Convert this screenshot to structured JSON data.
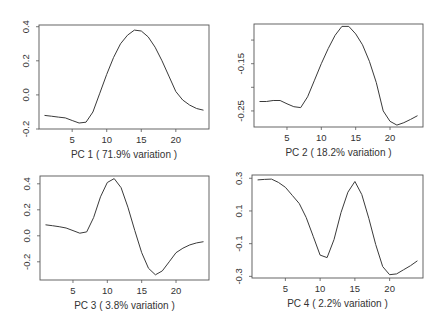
{
  "chart_data": [
    {
      "type": "line",
      "title": "",
      "xlabel": "PC 1 ( 71.9% variation )",
      "ylabel": "",
      "x": [
        1,
        2,
        3,
        4,
        5,
        6,
        7,
        8,
        9,
        10,
        11,
        12,
        13,
        14,
        15,
        16,
        17,
        18,
        19,
        20,
        21,
        22,
        23,
        24
      ],
      "values": [
        -0.12,
        -0.125,
        -0.13,
        -0.135,
        -0.15,
        -0.165,
        -0.16,
        -0.1,
        0.01,
        0.12,
        0.22,
        0.3,
        0.35,
        0.38,
        0.375,
        0.34,
        0.28,
        0.2,
        0.11,
        0.02,
        -0.03,
        -0.06,
        -0.08,
        -0.09
      ],
      "xticks": [
        5,
        10,
        15,
        20
      ],
      "yticks": [
        -0.2,
        0.0,
        0.2,
        0.4
      ],
      "ytick_labels": [
        "-0.2",
        "0.0",
        "0.2",
        "0.4"
      ],
      "xlim": [
        0.2,
        24.8
      ],
      "ylim": [
        -0.2,
        0.41
      ],
      "grid": false,
      "box": {
        "x": 39,
        "y": 25,
        "w": 170,
        "h": 104
      }
    },
    {
      "type": "line",
      "title": "",
      "xlabel": "PC 2 ( 18.2% variation )",
      "ylabel": "",
      "x": [
        1,
        2,
        3,
        4,
        5,
        6,
        7,
        8,
        9,
        10,
        11,
        12,
        13,
        14,
        15,
        16,
        17,
        18,
        19,
        20,
        21,
        22,
        23,
        24
      ],
      "values": [
        -0.23,
        -0.23,
        -0.228,
        -0.228,
        -0.235,
        -0.241,
        -0.243,
        -0.22,
        -0.185,
        -0.15,
        -0.118,
        -0.09,
        -0.071,
        -0.071,
        -0.087,
        -0.11,
        -0.145,
        -0.19,
        -0.25,
        -0.272,
        -0.28,
        -0.275,
        -0.268,
        -0.26
      ],
      "xticks": [
        5,
        10,
        15,
        20
      ],
      "yticks": [
        -0.1,
        -0.15,
        -0.2,
        -0.25
      ],
      "ytick_labels": [
        "",
        "-0.15",
        "",
        "-0.25"
      ],
      "xlim": [
        0.2,
        24.8
      ],
      "ylim": [
        -0.284,
        -0.066
      ],
      "grid": false,
      "box": {
        "x": 254,
        "y": 24,
        "w": 169,
        "h": 103
      }
    },
    {
      "type": "line",
      "title": "",
      "xlabel": "PC 3 ( 3.8% variation )",
      "ylabel": "",
      "x": [
        1,
        2,
        3,
        4,
        5,
        6,
        7,
        8,
        9,
        10,
        11,
        12,
        13,
        14,
        15,
        16,
        17,
        18,
        19,
        20,
        21,
        22,
        23,
        24
      ],
      "values": [
        0.085,
        0.078,
        0.07,
        0.06,
        0.04,
        0.02,
        0.03,
        0.14,
        0.3,
        0.41,
        0.44,
        0.37,
        0.22,
        0.04,
        -0.13,
        -0.25,
        -0.3,
        -0.27,
        -0.2,
        -0.13,
        -0.095,
        -0.07,
        -0.055,
        -0.045
      ],
      "xticks": [
        5,
        10,
        15,
        20
      ],
      "yticks": [
        -0.2,
        0.0,
        0.2,
        0.4
      ],
      "ytick_labels": [
        "-0.2",
        "0.0",
        "0.2",
        "0.4"
      ],
      "xlim": [
        0.2,
        24.8
      ],
      "ylim": [
        -0.34,
        0.46
      ],
      "grid": false,
      "box": {
        "x": 40,
        "y": 176,
        "w": 169,
        "h": 104
      }
    },
    {
      "type": "line",
      "title": "",
      "xlabel": "PC 4 ( 2.2% variation )",
      "ylabel": "",
      "x": [
        1,
        2,
        3,
        4,
        5,
        6,
        7,
        8,
        9,
        10,
        11,
        12,
        13,
        14,
        15,
        16,
        17,
        18,
        19,
        20,
        21,
        22,
        23,
        24
      ],
      "values": [
        0.29,
        0.293,
        0.295,
        0.275,
        0.245,
        0.195,
        0.145,
        0.06,
        -0.055,
        -0.17,
        -0.185,
        -0.075,
        0.09,
        0.215,
        0.28,
        0.2,
        0.055,
        -0.105,
        -0.24,
        -0.29,
        -0.285,
        -0.26,
        -0.235,
        -0.205
      ],
      "xticks": [
        5,
        10,
        15,
        20
      ],
      "yticks": [
        -0.3,
        -0.1,
        0.1,
        0.3
      ],
      "ytick_labels": [
        "-0.3",
        "-0.1",
        "0.1",
        "0.3"
      ],
      "xlim": [
        0.2,
        24.8
      ],
      "ylim": [
        -0.31,
        0.32
      ],
      "grid": false,
      "box": {
        "x": 252,
        "y": 175,
        "w": 171,
        "h": 103
      }
    }
  ]
}
